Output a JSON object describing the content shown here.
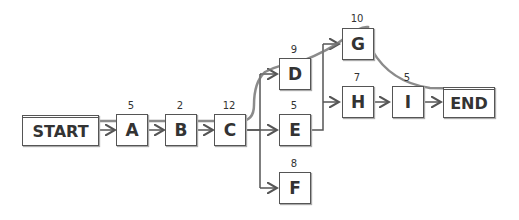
{
  "diagram": {
    "type": "network-critical-path",
    "nodes": [
      {
        "id": "START",
        "label": "START",
        "duration": null
      },
      {
        "id": "A",
        "label": "A",
        "duration": "5"
      },
      {
        "id": "B",
        "label": "B",
        "duration": "2"
      },
      {
        "id": "C",
        "label": "C",
        "duration": "12"
      },
      {
        "id": "D",
        "label": "D",
        "duration": "9"
      },
      {
        "id": "E",
        "label": "E",
        "duration": "5"
      },
      {
        "id": "F",
        "label": "F",
        "duration": "8"
      },
      {
        "id": "G",
        "label": "G",
        "duration": "10"
      },
      {
        "id": "H",
        "label": "H",
        "duration": "7"
      },
      {
        "id": "I",
        "label": "I",
        "duration": "5"
      },
      {
        "id": "END",
        "label": "END",
        "duration": null
      }
    ],
    "edges": [
      [
        "START",
        "A"
      ],
      [
        "A",
        "B"
      ],
      [
        "B",
        "C"
      ],
      [
        "C",
        "D"
      ],
      [
        "C",
        "E"
      ],
      [
        "C",
        "F"
      ],
      [
        "E",
        "G"
      ],
      [
        "E",
        "H"
      ],
      [
        "H",
        "I"
      ],
      [
        "I",
        "END"
      ]
    ],
    "critical_path": [
      "START",
      "A",
      "B",
      "C",
      "D",
      "G",
      "END"
    ],
    "colors": {
      "box_border": "#555555",
      "arrow": "#555555",
      "critical_path": "#777777"
    }
  }
}
